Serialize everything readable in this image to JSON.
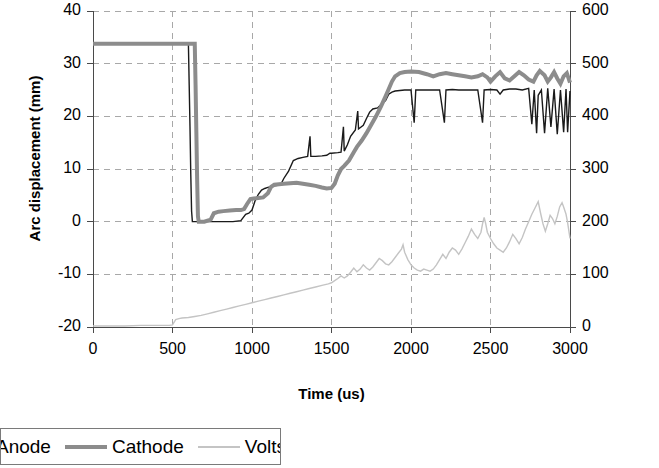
{
  "chart_data": {
    "type": "line",
    "title": "",
    "xlabel": "Time (us)",
    "ylabel": "Arc displacement (mm)",
    "ylabel_secondary": "Arc volts (V)",
    "xlim": [
      0,
      3000
    ],
    "ylim": [
      -20,
      40
    ],
    "ylim_secondary": [
      0,
      600
    ],
    "xticks": [
      0,
      500,
      1000,
      1500,
      2000,
      2500,
      3000
    ],
    "yticks": [
      -20,
      -10,
      0,
      10,
      20,
      30,
      40
    ],
    "yticks_secondary": [
      0,
      100,
      200,
      300,
      400,
      500,
      600
    ],
    "grid": true,
    "legend_position": "below-left",
    "series": [
      {
        "name": "Anode",
        "axis": "left",
        "color": "#1a1a1a",
        "width": 1.4,
        "points": [
          [
            0,
            33.8
          ],
          [
            120,
            33.8
          ],
          [
            250,
            33.8
          ],
          [
            400,
            33.8
          ],
          [
            520,
            33.8
          ],
          [
            600,
            33.8
          ],
          [
            605,
            26
          ],
          [
            610,
            18
          ],
          [
            615,
            9
          ],
          [
            620,
            2
          ],
          [
            625,
            0
          ],
          [
            700,
            0
          ],
          [
            760,
            0
          ],
          [
            820,
            0
          ],
          [
            880,
            0
          ],
          [
            930,
            0.2
          ],
          [
            960,
            1.4
          ],
          [
            980,
            1.6
          ],
          [
            1000,
            2.2
          ],
          [
            1020,
            4.0
          ],
          [
            1040,
            5.2
          ],
          [
            1060,
            6.0
          ],
          [
            1080,
            6.3
          ],
          [
            1100,
            6.5
          ],
          [
            1140,
            6.8
          ],
          [
            1180,
            7.0
          ],
          [
            1200,
            8.2
          ],
          [
            1230,
            9.6
          ],
          [
            1260,
            11.6
          ],
          [
            1290,
            12.0
          ],
          [
            1320,
            12.2
          ],
          [
            1350,
            12.4
          ],
          [
            1365,
            16.2
          ],
          [
            1370,
            12.4
          ],
          [
            1400,
            12.4
          ],
          [
            1440,
            12.5
          ],
          [
            1470,
            12.6
          ],
          [
            1490,
            13.0
          ],
          [
            1500,
            13.0
          ],
          [
            1540,
            13.1
          ],
          [
            1560,
            13.2
          ],
          [
            1575,
            18.0
          ],
          [
            1580,
            13.4
          ],
          [
            1600,
            14.6
          ],
          [
            1620,
            16.2
          ],
          [
            1650,
            17.4
          ],
          [
            1665,
            21.0
          ],
          [
            1670,
            17.6
          ],
          [
            1700,
            18.3
          ],
          [
            1720,
            19.6
          ],
          [
            1740,
            20.8
          ],
          [
            1760,
            21.4
          ],
          [
            1790,
            21.6
          ],
          [
            1810,
            22.2
          ],
          [
            1840,
            23.0
          ],
          [
            1860,
            24.2
          ],
          [
            1880,
            24.6
          ],
          [
            1900,
            24.8
          ],
          [
            1930,
            24.9
          ],
          [
            1960,
            25.0
          ],
          [
            1980,
            25.0
          ],
          [
            2000,
            25.0
          ],
          [
            2020,
            18.8
          ],
          [
            2030,
            25.0
          ],
          [
            2080,
            25.0
          ],
          [
            2140,
            25.0
          ],
          [
            2180,
            25.0
          ],
          [
            2210,
            18.8
          ],
          [
            2220,
            25.0
          ],
          [
            2260,
            25.1
          ],
          [
            2300,
            25.0
          ],
          [
            2340,
            25.0
          ],
          [
            2380,
            25.0
          ],
          [
            2420,
            25.0
          ],
          [
            2450,
            18.8
          ],
          [
            2460,
            25.0
          ],
          [
            2500,
            25.1
          ],
          [
            2540,
            25.0
          ],
          [
            2560,
            24.2
          ],
          [
            2580,
            25.0
          ],
          [
            2620,
            25.2
          ],
          [
            2660,
            25.2
          ],
          [
            2700,
            25.0
          ],
          [
            2740,
            25.3
          ],
          [
            2760,
            18.5
          ],
          [
            2775,
            25.0
          ],
          [
            2790,
            16.8
          ],
          [
            2800,
            24.0
          ],
          [
            2820,
            25.0
          ],
          [
            2840,
            16.8
          ],
          [
            2860,
            25.3
          ],
          [
            2880,
            18.0
          ],
          [
            2900,
            25.2
          ],
          [
            2920,
            16.6
          ],
          [
            2940,
            25.0
          ],
          [
            2960,
            17.0
          ],
          [
            2975,
            25.2
          ],
          [
            2985,
            17.0
          ],
          [
            3000,
            24.8
          ]
        ]
      },
      {
        "name": "Cathode",
        "axis": "left",
        "color": "#8c8c8c",
        "width": 4.0,
        "points": [
          [
            0,
            33.8
          ],
          [
            150,
            33.8
          ],
          [
            320,
            33.8
          ],
          [
            480,
            33.8
          ],
          [
            600,
            33.8
          ],
          [
            640,
            33.8
          ],
          [
            645,
            26
          ],
          [
            650,
            17
          ],
          [
            655,
            8
          ],
          [
            660,
            1
          ],
          [
            665,
            0
          ],
          [
            700,
            0
          ],
          [
            740,
            0.4
          ],
          [
            760,
            1.6
          ],
          [
            790,
            1.9
          ],
          [
            820,
            2.0
          ],
          [
            860,
            2.1
          ],
          [
            900,
            2.2
          ],
          [
            930,
            2.2
          ],
          [
            950,
            2.4
          ],
          [
            970,
            3.4
          ],
          [
            990,
            4.3
          ],
          [
            1010,
            4.4
          ],
          [
            1040,
            4.5
          ],
          [
            1070,
            4.6
          ],
          [
            1100,
            5.4
          ],
          [
            1120,
            6.6
          ],
          [
            1140,
            7.0
          ],
          [
            1170,
            7.1
          ],
          [
            1200,
            7.2
          ],
          [
            1240,
            7.3
          ],
          [
            1280,
            7.4
          ],
          [
            1320,
            7.2
          ],
          [
            1360,
            7.0
          ],
          [
            1400,
            6.8
          ],
          [
            1440,
            6.5
          ],
          [
            1470,
            6.3
          ],
          [
            1500,
            6.4
          ],
          [
            1520,
            7.2
          ],
          [
            1540,
            8.8
          ],
          [
            1560,
            10.0
          ],
          [
            1580,
            10.6
          ],
          [
            1610,
            11.6
          ],
          [
            1640,
            13.2
          ],
          [
            1660,
            14.2
          ],
          [
            1690,
            15.4
          ],
          [
            1720,
            16.8
          ],
          [
            1750,
            18.4
          ],
          [
            1780,
            20.0
          ],
          [
            1810,
            21.8
          ],
          [
            1840,
            23.8
          ],
          [
            1860,
            25.2
          ],
          [
            1880,
            26.6
          ],
          [
            1900,
            27.6
          ],
          [
            1930,
            28.2
          ],
          [
            1960,
            28.4
          ],
          [
            2000,
            28.5
          ],
          [
            2050,
            28.4
          ],
          [
            2100,
            28.0
          ],
          [
            2140,
            27.6
          ],
          [
            2180,
            28.0
          ],
          [
            2220,
            28.2
          ],
          [
            2260,
            28.0
          ],
          [
            2300,
            27.8
          ],
          [
            2340,
            27.6
          ],
          [
            2380,
            27.4
          ],
          [
            2420,
            27.6
          ],
          [
            2450,
            28.0
          ],
          [
            2480,
            27.4
          ],
          [
            2500,
            26.6
          ],
          [
            2530,
            27.6
          ],
          [
            2560,
            28.4
          ],
          [
            2590,
            27.2
          ],
          [
            2620,
            26.8
          ],
          [
            2650,
            27.6
          ],
          [
            2680,
            28.4
          ],
          [
            2710,
            27.8
          ],
          [
            2740,
            27.0
          ],
          [
            2770,
            26.6
          ],
          [
            2790,
            27.8
          ],
          [
            2810,
            28.6
          ],
          [
            2840,
            27.8
          ],
          [
            2860,
            26.6
          ],
          [
            2880,
            27.4
          ],
          [
            2900,
            28.4
          ],
          [
            2920,
            27.2
          ],
          [
            2940,
            26.2
          ],
          [
            2960,
            27.6
          ],
          [
            2980,
            28.2
          ],
          [
            3000,
            26.4
          ]
        ]
      },
      {
        "name": "Volts",
        "axis": "right",
        "color": "#c4c4c4",
        "width": 1.4,
        "points": [
          [
            0,
            2
          ],
          [
            100,
            2
          ],
          [
            200,
            2
          ],
          [
            300,
            3
          ],
          [
            400,
            3
          ],
          [
            480,
            3
          ],
          [
            500,
            4
          ],
          [
            520,
            14
          ],
          [
            540,
            16
          ],
          [
            560,
            17
          ],
          [
            600,
            18
          ],
          [
            640,
            20
          ],
          [
            680,
            22
          ],
          [
            720,
            25
          ],
          [
            760,
            28
          ],
          [
            800,
            31
          ],
          [
            840,
            34
          ],
          [
            880,
            37
          ],
          [
            920,
            40
          ],
          [
            960,
            43
          ],
          [
            1000,
            46
          ],
          [
            1040,
            49
          ],
          [
            1080,
            52
          ],
          [
            1120,
            55
          ],
          [
            1160,
            58
          ],
          [
            1200,
            61
          ],
          [
            1240,
            64
          ],
          [
            1280,
            67
          ],
          [
            1320,
            70
          ],
          [
            1360,
            73
          ],
          [
            1400,
            76
          ],
          [
            1440,
            79
          ],
          [
            1480,
            82
          ],
          [
            1500,
            84
          ],
          [
            1520,
            88
          ],
          [
            1540,
            92
          ],
          [
            1560,
            97
          ],
          [
            1580,
            93
          ],
          [
            1600,
            97
          ],
          [
            1620,
            104
          ],
          [
            1640,
            112
          ],
          [
            1660,
            105
          ],
          [
            1680,
            110
          ],
          [
            1700,
            118
          ],
          [
            1720,
            112
          ],
          [
            1740,
            108
          ],
          [
            1760,
            114
          ],
          [
            1780,
            122
          ],
          [
            1800,
            130
          ],
          [
            1820,
            126
          ],
          [
            1840,
            120
          ],
          [
            1860,
            118
          ],
          [
            1880,
            124
          ],
          [
            1900,
            132
          ],
          [
            1920,
            140
          ],
          [
            1940,
            148
          ],
          [
            1950,
            156
          ],
          [
            1960,
            142
          ],
          [
            1980,
            128
          ],
          [
            2000,
            118
          ],
          [
            2020,
            112
          ],
          [
            2040,
            108
          ],
          [
            2060,
            106
          ],
          [
            2080,
            110
          ],
          [
            2100,
            108
          ],
          [
            2120,
            106
          ],
          [
            2140,
            110
          ],
          [
            2160,
            118
          ],
          [
            2180,
            128
          ],
          [
            2200,
            138
          ],
          [
            2220,
            130
          ],
          [
            2240,
            142
          ],
          [
            2260,
            150
          ],
          [
            2280,
            146
          ],
          [
            2300,
            138
          ],
          [
            2320,
            148
          ],
          [
            2340,
            160
          ],
          [
            2360,
            172
          ],
          [
            2380,
            186
          ],
          [
            2400,
            176
          ],
          [
            2420,
            168
          ],
          [
            2440,
            180
          ],
          [
            2450,
            196
          ],
          [
            2460,
            208
          ],
          [
            2470,
            196
          ],
          [
            2480,
            180
          ],
          [
            2500,
            168
          ],
          [
            2520,
            158
          ],
          [
            2540,
            150
          ],
          [
            2560,
            146
          ],
          [
            2580,
            142
          ],
          [
            2600,
            150
          ],
          [
            2620,
            162
          ],
          [
            2640,
            176
          ],
          [
            2660,
            168
          ],
          [
            2680,
            158
          ],
          [
            2700,
            170
          ],
          [
            2720,
            186
          ],
          [
            2740,
            200
          ],
          [
            2760,
            214
          ],
          [
            2780,
            226
          ],
          [
            2800,
            238
          ],
          [
            2815,
            216
          ],
          [
            2830,
            196
          ],
          [
            2845,
            182
          ],
          [
            2860,
            196
          ],
          [
            2875,
            212
          ],
          [
            2890,
            206
          ],
          [
            2905,
            196
          ],
          [
            2920,
            210
          ],
          [
            2935,
            228
          ],
          [
            2950,
            236
          ],
          [
            2960,
            228
          ],
          [
            2975,
            214
          ],
          [
            2985,
            198
          ],
          [
            3000,
            168
          ]
        ]
      }
    ]
  },
  "axes": {
    "left_title": "Arc displacement (mm)",
    "right_title": "Arc volts (V)",
    "x_title": "Time (us)",
    "left_ticks": [
      "40",
      "30",
      "20",
      "10",
      "0",
      "-10",
      "-20"
    ],
    "right_ticks": [
      "600",
      "500",
      "400",
      "300",
      "200",
      "100",
      "0"
    ],
    "x_ticks": [
      "0",
      "500",
      "1000",
      "1500",
      "2000",
      "2500",
      "3000"
    ]
  },
  "legend": {
    "items": [
      {
        "label": "Anode",
        "swatch": "leg-anode"
      },
      {
        "label": "Cathode",
        "swatch": "leg-cathode"
      },
      {
        "label": "Volts",
        "swatch": "leg-volts"
      }
    ]
  },
  "colors": {
    "anode": "#1a1a1a",
    "cathode": "#8c8c8c",
    "volts": "#c4c4c4",
    "grid": "#a8a8a8",
    "axis": "#4a4a4a"
  }
}
